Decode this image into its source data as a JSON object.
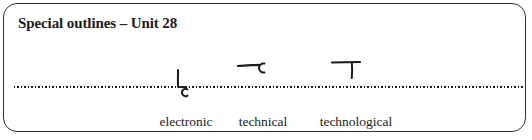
{
  "panel": {
    "title": "Special outlines – Unit 28"
  },
  "outlines": [
    {
      "word": "electronic",
      "icon": "teeline-outline-electronic"
    },
    {
      "word": "technical",
      "icon": "teeline-outline-technical"
    },
    {
      "word": "technological",
      "icon": "teeline-outline-technological"
    }
  ],
  "colors": {
    "border": "#2f2f2f",
    "ink": "#1c1c1c",
    "background": "#ffffff"
  }
}
